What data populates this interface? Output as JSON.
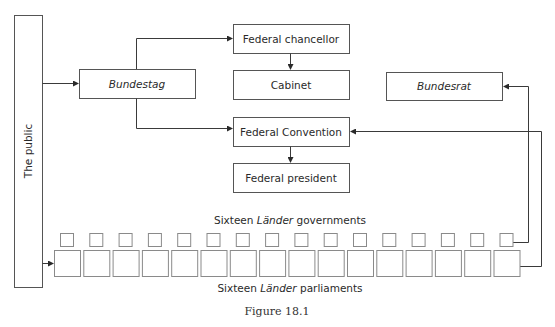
{
  "diagram": {
    "public_box": {
      "label": "The public"
    },
    "bundestag": {
      "label": "Bundestag",
      "italic": true
    },
    "federal_chancellor": {
      "label": "Federal chancellor"
    },
    "cabinet": {
      "label": "Cabinet"
    },
    "federal_convention": {
      "label": "Federal Convention"
    },
    "federal_president": {
      "label": "Federal president"
    },
    "bundesrat": {
      "label": "Bundesrat",
      "italic": true
    },
    "lander_governments": {
      "label_prefix": "Sixteen ",
      "label_italic": "Länder",
      "label_suffix": " governments",
      "count": 16
    },
    "lander_parliaments": {
      "label_prefix": "Sixteen ",
      "label_italic": "Länder",
      "label_suffix": " parliaments",
      "count": 16
    },
    "edges": [
      {
        "from": "The public",
        "to": "Bundestag"
      },
      {
        "from": "The public",
        "to": "Sixteen Länder parliaments"
      },
      {
        "from": "Bundestag",
        "to": "Federal chancellor"
      },
      {
        "from": "Bundestag",
        "to": "Federal Convention"
      },
      {
        "from": "Federal chancellor",
        "to": "Cabinet"
      },
      {
        "from": "Federal Convention",
        "to": "Federal president"
      },
      {
        "from": "Sixteen Länder governments",
        "to": "Bundesrat"
      },
      {
        "from": "Sixteen Länder parliaments",
        "to": "Federal Convention"
      }
    ],
    "colors": {
      "line": "#3a3a3a",
      "box_border": "#555555",
      "small_box_border": "#8a8a8a"
    }
  },
  "caption": "Figure 18.1"
}
